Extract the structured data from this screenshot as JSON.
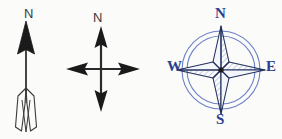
{
  "canvas": {
    "width": 282,
    "height": 139,
    "background": "#fbfbfa"
  },
  "colors": {
    "ink_black": "#1a1a1a",
    "ink_gray": "#3a3a3a",
    "compass_blue": "#2c3f8f",
    "compass_ring_blue": "#6b7fc4",
    "hatch_blue": "#8fa2d4"
  },
  "figures": [
    {
      "id": "arrow",
      "name": "north-arrow-with-fletching",
      "description": "vertical arrow pointing up with solid triangular head and V-shaped feather nock at base",
      "label": "N"
    },
    {
      "id": "cross",
      "name": "four-way-direction-cross",
      "description": "four-pointed cross with solid arrowheads on all four ends, north labeled",
      "label": "N"
    },
    {
      "id": "compass",
      "name": "compass-rose",
      "description": "four-point star compass rose inside double circle with cardinal letters",
      "labels": {
        "north": "N",
        "south": "S",
        "west": "W",
        "east": "E"
      }
    }
  ]
}
